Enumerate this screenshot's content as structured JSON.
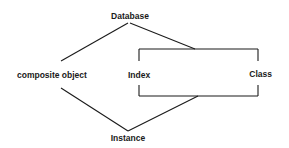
{
  "diagram": {
    "nodes": {
      "database": "Database",
      "composite_object": "composite object",
      "index": "Index",
      "class": "Class",
      "instance": "Instance"
    },
    "group": {
      "members": [
        "Index",
        "Class"
      ]
    },
    "edges": [
      {
        "from": "Database",
        "to": "composite object"
      },
      {
        "from": "Database",
        "to": "Index/Class group"
      },
      {
        "from": "composite object",
        "to": "Instance"
      },
      {
        "from": "Index/Class group",
        "to": "Instance"
      }
    ],
    "colors": {
      "line": "#1a1a1a",
      "background": "#ffffff"
    }
  }
}
